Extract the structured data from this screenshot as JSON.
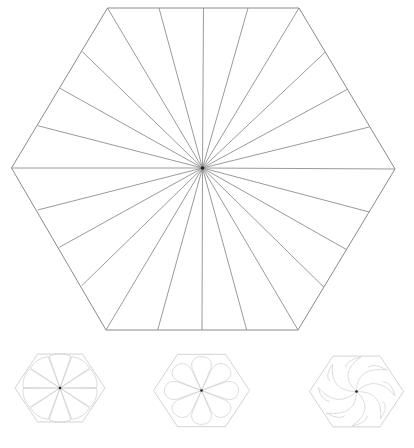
{
  "main_figure": {
    "name": "hexagon-radial-division",
    "stroke": "#8a8a8a",
    "center": [
      202.5,
      168
    ],
    "vertices": [
      [
        107.5,
        8
      ],
      [
        299,
        8
      ],
      [
        395,
        169
      ],
      [
        298,
        330
      ],
      [
        106,
        330
      ],
      [
        11.5,
        168
      ]
    ],
    "edge_points": [
      [
        159,
        8
      ],
      [
        203.5,
        8
      ],
      [
        248,
        8
      ],
      [
        325,
        52.3
      ],
      [
        347.3,
        89.3
      ],
      [
        369.3,
        127
      ],
      [
        369.3,
        212
      ],
      [
        347.3,
        250
      ],
      [
        324,
        287.3
      ],
      [
        246.7,
        330
      ],
      [
        202,
        330
      ],
      [
        157.7,
        330
      ],
      [
        81.7,
        285.7
      ],
      [
        59.3,
        247.3
      ],
      [
        37.7,
        210
      ],
      [
        37.7,
        125.7
      ],
      [
        60,
        88.3
      ],
      [
        82.3,
        51.7
      ]
    ]
  },
  "thumbnails": [
    {
      "name": "teardrop-petals",
      "center": [
        60,
        388
      ],
      "radius": 45,
      "petals": 10,
      "style": "teardrop"
    },
    {
      "name": "lobed-petals",
      "center": [
        201.5,
        390.5
      ],
      "radius": 48,
      "petals": 8,
      "style": "lobe"
    },
    {
      "name": "swirl-petals",
      "center": [
        356.5,
        391.5
      ],
      "radius": 47,
      "petals": 8,
      "style": "swirl"
    }
  ]
}
